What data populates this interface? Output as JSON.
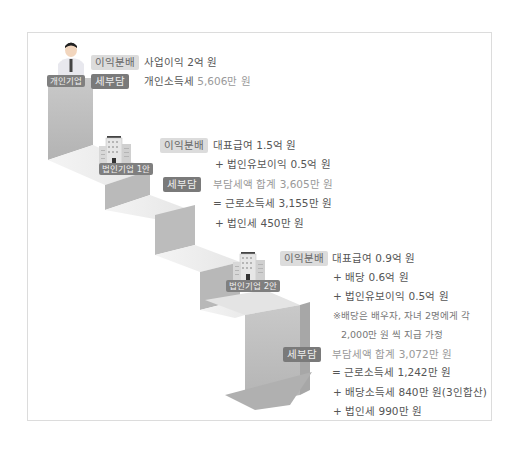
{
  "diagram": {
    "type": "staircase-comparison",
    "colors": {
      "stair_front": "#bdbdbd",
      "stair_top": "#eeeeee",
      "stair_side": "#a9a9a9",
      "profit_badge_bg": "#dcdcdc",
      "tax_badge_bg": "#7a7a7a",
      "entity_label_bg": "#7f7f7f"
    },
    "stages": [
      {
        "entity_icon": "person-icon",
        "entity_label": "개인기업",
        "profit_badge": "이익분배",
        "profit_lines": [
          "사업이익 2억 원"
        ],
        "tax_badge": "세부담",
        "tax_line_prefix": "개인소득세 ",
        "tax_line_value": "5,606만 원",
        "tax_lines": []
      },
      {
        "entity_icon": "building-icon",
        "entity_label": "법인기업 1안",
        "profit_badge": "이익분배",
        "profit_lines": [
          "대표급여 1.5억 원",
          "+ 법인유보이익 0.5억 원"
        ],
        "tax_badge": "세부담",
        "tax_lines": [
          "부담세액 합계 3,605만 원",
          "= 근로소득세 3,155만 원",
          "+ 법인세 450만 원"
        ]
      },
      {
        "entity_icon": "building-icon",
        "entity_label": "법인기업 2안",
        "profit_badge": "이익분배",
        "profit_lines": [
          "대표급여 0.9억 원",
          "+ 배당 0.6억 원",
          "+ 법인유보이익 0.5억 원"
        ],
        "note_lines": [
          "※배당은 배우자, 자녀 2명에게 각",
          "2,000만 원 씩 지급 가정"
        ],
        "tax_badge": "세부담",
        "tax_lines": [
          "부담세액 합계 3,072만 원",
          "= 근로소득세 1,242만 원",
          "+ 배당소득세 840만 원(3인합산)",
          "+ 법인세 990만 원"
        ]
      }
    ]
  }
}
